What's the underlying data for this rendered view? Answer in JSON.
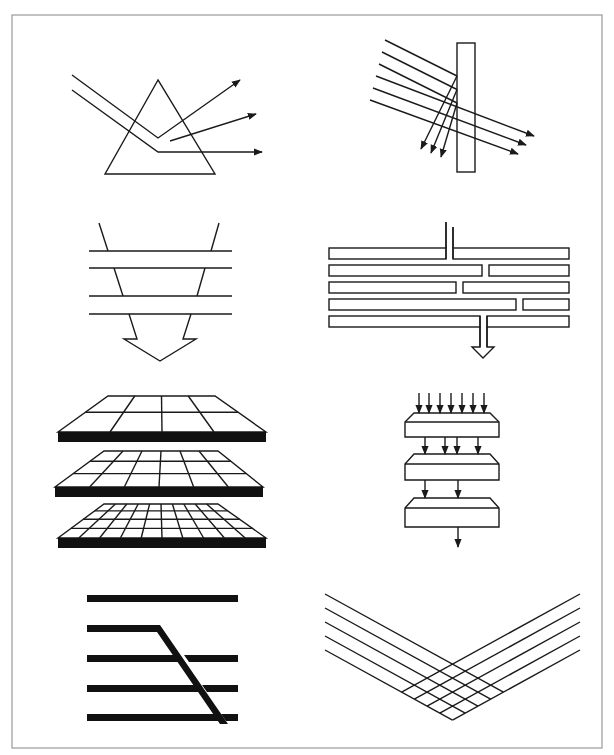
{
  "figure": {
    "panels": [
      {
        "id": "prism-dispersion",
        "description": "Light beam entering a triangular prism and splitting into three outgoing rays",
        "outgoing_rays": 3
      },
      {
        "id": "plate-reflection-transmission",
        "description": "Six parallel rays hitting a vertical plate; three reflected, three transmitted",
        "incoming_rays": 6,
        "reflected_rays": 3,
        "transmitted_rays": 3
      },
      {
        "id": "funnel-through-layers",
        "description": "Funnel narrowing through four horizontal layers into a downward arrow",
        "layers": 4
      },
      {
        "id": "staggered-channels",
        "description": "Five stacked bars with staggered gaps forming a winding channel to a downward arrow",
        "rows": 5
      },
      {
        "id": "grid-layers",
        "description": "Three stacked perspective grids of increasing resolution",
        "grids": [
          {
            "columns": 4,
            "rows": 2
          },
          {
            "columns": 6,
            "rows": 3
          },
          {
            "columns": 10,
            "rows": 4
          }
        ]
      },
      {
        "id": "hierarchical-reduction",
        "description": "Three stacked blocks with arrows reducing from 7 to 4 to 2 to 1",
        "arrow_counts": [
          7,
          4,
          2,
          1
        ]
      },
      {
        "id": "diagonal-crossing-bars",
        "description": "Five thick horizontal bars with one bar bending diagonally across the lower bars",
        "bars": 5
      },
      {
        "id": "v-lattice",
        "description": "Two sets of five parallel lines converging in a V shape and crossing to form a lattice",
        "lines_per_side": 5
      }
    ]
  }
}
